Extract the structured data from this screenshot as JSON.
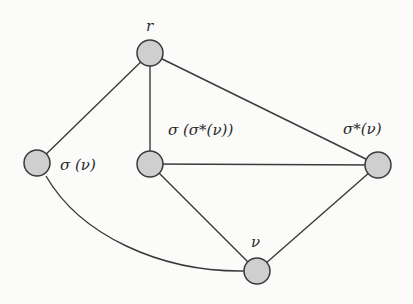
{
  "diagram": {
    "type": "graph",
    "colors": {
      "node_fill": "#cfcfcf",
      "node_stroke": "#3a3a3a",
      "edge": "#3a3a3a",
      "background": "#fbfbfa"
    },
    "nodes": [
      {
        "id": "r",
        "label": "r",
        "x": 150,
        "y": 53
      },
      {
        "id": "sigma_v",
        "label": "σ (ν)",
        "x": 37,
        "y": 163
      },
      {
        "id": "sigma_sigma_star_v",
        "label": "σ (σ*(ν))",
        "x": 150,
        "y": 164
      },
      {
        "id": "sigma_star_v",
        "label": "σ*(ν)",
        "x": 378,
        "y": 165
      },
      {
        "id": "v",
        "label": "ν",
        "x": 257,
        "y": 271
      }
    ],
    "edges": [
      {
        "from": "r",
        "to": "sigma_v",
        "shape": "straight"
      },
      {
        "from": "r",
        "to": "sigma_sigma_star_v",
        "shape": "straight"
      },
      {
        "from": "r",
        "to": "sigma_star_v",
        "shape": "straight"
      },
      {
        "from": "sigma_sigma_star_v",
        "to": "sigma_star_v",
        "shape": "straight"
      },
      {
        "from": "sigma_sigma_star_v",
        "to": "v",
        "shape": "straight"
      },
      {
        "from": "sigma_star_v",
        "to": "v",
        "shape": "straight"
      },
      {
        "from": "sigma_v",
        "to": "v",
        "shape": "curved"
      }
    ]
  }
}
